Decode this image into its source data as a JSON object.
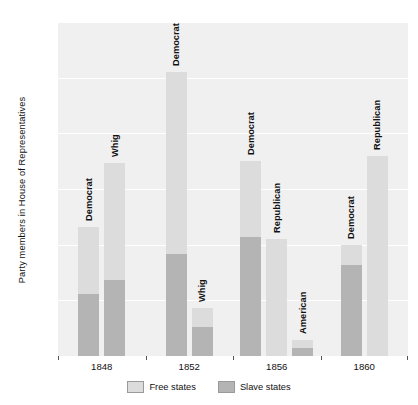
{
  "chart_data": {
    "type": "bar",
    "title": "",
    "subtitle": "",
    "xlabel": "",
    "ylabel": "Party members in House of Representatives",
    "ylim": [
      0,
      300
    ],
    "yticks": [
      50,
      100,
      150,
      200,
      250,
      300
    ],
    "grid": true,
    "stacked": true,
    "legend_position": "bottom",
    "categories": [
      "1848",
      "1852",
      "1856",
      "1860"
    ],
    "series": [
      {
        "name": "Free states",
        "color": "#dcdcdc"
      },
      {
        "name": "Slave states",
        "color": "#b4b4b4"
      }
    ],
    "groups": [
      {
        "category": "1848",
        "bars": [
          {
            "label": "Democrat",
            "free": 60,
            "slave": 56,
            "total": 116
          },
          {
            "label": "Whig",
            "free": 105,
            "slave": 68,
            "total": 173
          }
        ]
      },
      {
        "category": "1852",
        "bars": [
          {
            "label": "Democrat",
            "free": 163,
            "slave": 92,
            "total": 255
          },
          {
            "label": "Whig",
            "free": 17,
            "slave": 26,
            "total": 43
          }
        ]
      },
      {
        "category": "1856",
        "bars": [
          {
            "label": "Democrat",
            "free": 68,
            "slave": 107,
            "total": 175
          },
          {
            "label": "Republican",
            "free": 105,
            "slave": 0,
            "total": 105
          },
          {
            "label": "American",
            "free": 7,
            "slave": 7,
            "total": 14
          }
        ]
      },
      {
        "category": "1860",
        "bars": [
          {
            "label": "Democrat",
            "free": 18,
            "slave": 82,
            "total": 100
          },
          {
            "label": "Republican",
            "free": 180,
            "slave": 0,
            "total": 180
          }
        ]
      }
    ]
  },
  "legend": {
    "items": [
      {
        "label": "Free states",
        "color": "#dcdcdc"
      },
      {
        "label": "Slave states",
        "color": "#b4b4b4"
      }
    ]
  },
  "axes": {
    "y_title": "Party members in House of Representatives"
  }
}
